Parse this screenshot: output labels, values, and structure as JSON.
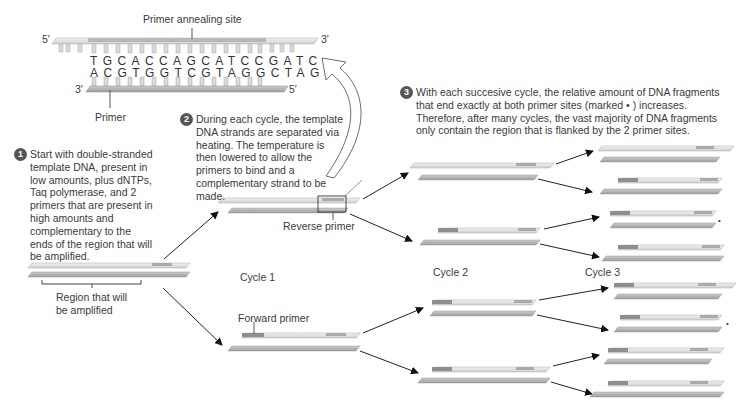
{
  "top_detail": {
    "annealing_label": "Primer annealing site",
    "primer_label": "Primer",
    "top_strand_5": "5′",
    "top_strand_3": "3′",
    "bottom_strand_3": "3′",
    "bottom_strand_5": "5′",
    "top_sequence": "TGCACCAGCATCCGATC",
    "bottom_sequence": "ACGTGGTCGTAGGCTAG"
  },
  "steps": [
    {
      "number": "1",
      "text": "Start with double-stranded template DNA, present in low amounts, plus dNTPs, Taq polymerase, and 2 primers that are present in high amounts and complementary to the ends of the region that will be amplified."
    },
    {
      "number": "2",
      "text": "During each cycle, the template DNA strands are separated via heating. The temperature is then lowered to allow the primers to bind and a complementary strand to be made."
    },
    {
      "number": "3",
      "text": "With each succesive cycle, the relative amount of DNA fragments that end exactly at both primer sites (marked • ) increases. Therefore, after many cycles, the vast majority of DNA fragments only contain the region that is flanked by the 2 primer sites."
    }
  ],
  "labels": {
    "region": "Region that will be amplified",
    "reverse_primer": "Reverse primer",
    "forward_primer": "Forward primer",
    "cycle1": "Cycle 1",
    "cycle2": "Cycle 2",
    "cycle3": "Cycle 3",
    "marker": "•"
  },
  "colors": {
    "strand_light": "#e4e4e4",
    "strand_dark": "#b4b4b4",
    "primer": "#8e8e8e",
    "text": "#3a3a3a",
    "badge": "#555555"
  }
}
